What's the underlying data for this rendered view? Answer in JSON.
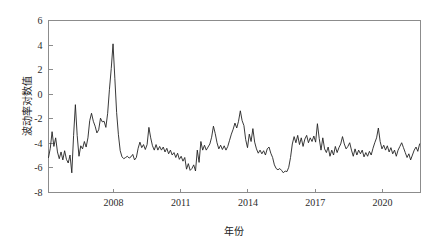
{
  "chart_data": {
    "type": "line",
    "title": "",
    "xlabel": "年份",
    "ylabel": "波动率对数值",
    "xlim": [
      2005.1,
      2021.7
    ],
    "ylim": [
      -8,
      6
    ],
    "xticks": [
      2008,
      2011,
      2014,
      2017,
      2020
    ],
    "xtick_labels": [
      "2008",
      "2011",
      "2014",
      "2017",
      "2020"
    ],
    "yticks": [
      -8,
      -6,
      -4,
      -2,
      0,
      2,
      4,
      6
    ],
    "ytick_labels": [
      "-8",
      "-6",
      "-4",
      "-2",
      "0",
      "2",
      "4",
      "6"
    ],
    "grid": false,
    "legend": null,
    "line_color": "#232323",
    "frame_color": "#8c8c8c",
    "background_color": "#ffffff",
    "series": [
      {
        "name": "波动率对数值",
        "x": [
          2005.1,
          2005.18,
          2005.26,
          2005.34,
          2005.42,
          2005.5,
          2005.58,
          2005.66,
          2005.74,
          2005.82,
          2005.9,
          2005.98,
          2006.06,
          2006.14,
          2006.22,
          2006.3,
          2006.38,
          2006.46,
          2006.54,
          2006.62,
          2006.7,
          2006.78,
          2006.86,
          2006.94,
          2007.02,
          2007.1,
          2007.18,
          2007.26,
          2007.34,
          2007.42,
          2007.5,
          2007.58,
          2007.66,
          2007.74,
          2007.82,
          2007.9,
          2007.98,
          2008.06,
          2008.14,
          2008.22,
          2008.3,
          2008.38,
          2008.46,
          2008.54,
          2008.62,
          2008.7,
          2008.78,
          2008.86,
          2008.94,
          2009.02,
          2009.1,
          2009.18,
          2009.26,
          2009.34,
          2009.42,
          2009.5,
          2009.58,
          2009.66,
          2009.74,
          2009.82,
          2009.9,
          2009.98,
          2010.06,
          2010.14,
          2010.22,
          2010.3,
          2010.38,
          2010.46,
          2010.54,
          2010.62,
          2010.7,
          2010.78,
          2010.86,
          2010.94,
          2011.02,
          2011.1,
          2011.18,
          2011.26,
          2011.34,
          2011.42,
          2011.5,
          2011.58,
          2011.66,
          2011.74,
          2011.82,
          2011.9,
          2011.98,
          2012.06,
          2012.14,
          2012.22,
          2012.3,
          2012.38,
          2012.46,
          2012.54,
          2012.62,
          2012.7,
          2012.78,
          2012.86,
          2012.94,
          2013.02,
          2013.1,
          2013.18,
          2013.26,
          2013.34,
          2013.42,
          2013.5,
          2013.58,
          2013.66,
          2013.74,
          2013.82,
          2013.9,
          2013.98,
          2014.06,
          2014.14,
          2014.22,
          2014.3,
          2014.38,
          2014.46,
          2014.54,
          2014.62,
          2014.7,
          2014.78,
          2014.86,
          2014.94,
          2015.02,
          2015.1,
          2015.18,
          2015.26,
          2015.34,
          2015.42,
          2015.5,
          2015.58,
          2015.66,
          2015.74,
          2015.82,
          2015.9,
          2015.98,
          2016.06,
          2016.14,
          2016.22,
          2016.3,
          2016.38,
          2016.46,
          2016.54,
          2016.62,
          2016.7,
          2016.78,
          2016.86,
          2016.94,
          2017.02,
          2017.1,
          2017.18,
          2017.26,
          2017.34,
          2017.42,
          2017.5,
          2017.58,
          2017.66,
          2017.74,
          2017.82,
          2017.9,
          2017.98,
          2018.06,
          2018.14,
          2018.22,
          2018.3,
          2018.38,
          2018.46,
          2018.54,
          2018.62,
          2018.7,
          2018.78,
          2018.86,
          2018.94,
          2019.02,
          2019.1,
          2019.18,
          2019.26,
          2019.34,
          2019.42,
          2019.5,
          2019.58,
          2019.66,
          2019.74,
          2019.82,
          2019.9,
          2019.98,
          2020.06,
          2020.14,
          2020.22,
          2020.3,
          2020.38,
          2020.46,
          2020.54,
          2020.62,
          2020.7,
          2020.78,
          2020.86,
          2020.94,
          2021.02,
          2021.1,
          2021.18,
          2021.26,
          2021.34,
          2021.42,
          2021.5,
          2021.58,
          2021.66
        ],
        "values": [
          -5.15,
          -4.4,
          -3.05,
          -4.25,
          -3.55,
          -4.7,
          -5.25,
          -4.7,
          -5.35,
          -4.6,
          -5.3,
          -5.6,
          -4.95,
          -6.4,
          -3.35,
          -0.85,
          -3.35,
          -5.05,
          -4.2,
          -4.45,
          -3.85,
          -4.3,
          -3.55,
          -2.15,
          -1.55,
          -2.2,
          -2.6,
          -3.15,
          -2.9,
          -1.95,
          -2.25,
          -2.2,
          -2.7,
          -1.55,
          0.4,
          2.1,
          4.1,
          1.3,
          -1.5,
          -3.3,
          -4.6,
          -5.1,
          -5.25,
          -5.15,
          -5.05,
          -5.2,
          -5.1,
          -4.9,
          -5.35,
          -5.15,
          -4.4,
          -3.9,
          -4.35,
          -4.1,
          -4.5,
          -4.1,
          -2.7,
          -3.55,
          -4.2,
          -4.55,
          -4.1,
          -4.55,
          -4.25,
          -4.55,
          -4.3,
          -4.7,
          -4.4,
          -4.85,
          -4.55,
          -4.95,
          -4.75,
          -5.15,
          -4.8,
          -5.3,
          -5.05,
          -5.45,
          -5.15,
          -6.1,
          -5.65,
          -6.2,
          -6.05,
          -5.75,
          -6.25,
          -4.55,
          -5.55,
          -3.85,
          -4.55,
          -4.15,
          -4.55,
          -4.3,
          -4.05,
          -3.5,
          -2.6,
          -3.2,
          -3.95,
          -4.45,
          -4.15,
          -4.5,
          -4.2,
          -4.55,
          -4.25,
          -3.75,
          -3.25,
          -2.85,
          -2.35,
          -2.75,
          -2.2,
          -1.35,
          -2.15,
          -2.55,
          -3.7,
          -4.35,
          -3.25,
          -3.85,
          -2.8,
          -3.9,
          -4.45,
          -4.8,
          -4.55,
          -4.85,
          -4.6,
          -4.95,
          -4.45,
          -4.3,
          -4.8,
          -5.15,
          -5.75,
          -6.05,
          -6.15,
          -6.05,
          -6.2,
          -6.4,
          -6.25,
          -6.3,
          -5.95,
          -5.15,
          -4.05,
          -3.45,
          -3.95,
          -3.35,
          -4.1,
          -3.55,
          -4.25,
          -3.65,
          -3.35,
          -3.95,
          -3.55,
          -3.85,
          -3.4,
          -3.9,
          -2.4,
          -3.6,
          -4.55,
          -3.55,
          -4.45,
          -4.75,
          -4.3,
          -5.05,
          -4.55,
          -4.95,
          -4.25,
          -4.75,
          -4.35,
          -4.05,
          -3.45,
          -4.05,
          -4.45,
          -4.25,
          -3.95,
          -4.55,
          -5.05,
          -4.45,
          -4.95,
          -4.55,
          -4.85,
          -4.55,
          -5.1,
          -4.75,
          -5.05,
          -4.65,
          -4.95,
          -4.4,
          -3.95,
          -3.55,
          -2.75,
          -3.85,
          -4.45,
          -4.15,
          -4.55,
          -4.2,
          -4.7,
          -4.35,
          -4.85,
          -4.55,
          -5.05,
          -4.55,
          -4.25,
          -3.95,
          -4.35,
          -4.75,
          -5.15,
          -4.85,
          -5.35,
          -4.95,
          -4.55,
          -4.3,
          -4.65,
          -4.05
        ]
      }
    ]
  }
}
